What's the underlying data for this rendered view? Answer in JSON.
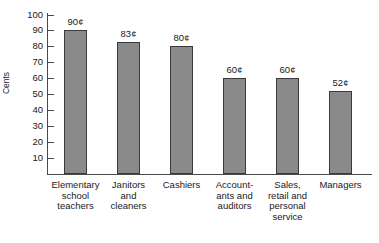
{
  "chart_data": {
    "type": "bar",
    "title": "",
    "xlabel": "",
    "ylabel": "Cents",
    "ylim": [
      0,
      100
    ],
    "ytick_labels": [
      "100",
      "90",
      "80",
      "70",
      "60",
      "50",
      "40",
      "30",
      "20",
      "10"
    ],
    "ytick_values": [
      100,
      90,
      80,
      70,
      60,
      50,
      40,
      30,
      20,
      10
    ],
    "grid": false,
    "legend": false,
    "categories": [
      "Elementary\nschool\nteachers",
      "Janitors\nand\ncleaners",
      "Cashiers",
      "Account-\nants and\nauditors",
      "Sales,\nretail and\npersonal\nservice",
      "Managers"
    ],
    "values": [
      90,
      83,
      80,
      60,
      60,
      52
    ],
    "value_labels": [
      "90¢",
      "83¢",
      "80¢",
      "60¢",
      "60¢",
      "52¢"
    ],
    "bar_color": "#8a8a8a",
    "bar_border_color": "#3a3a3a",
    "axis_color": "#4a4a4a"
  }
}
